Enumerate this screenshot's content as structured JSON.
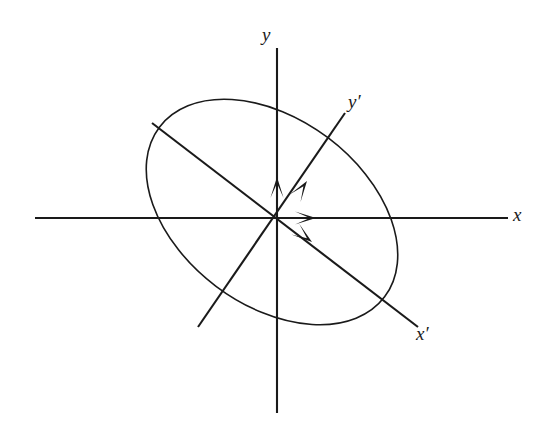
{
  "figure": {
    "kind": "diagram",
    "background_color": "#ffffff",
    "stroke_color": "#1a1a1a",
    "canvas": {
      "width": 540,
      "height": 442
    }
  },
  "labels": {
    "y_axis": "y",
    "x_axis": "x",
    "y_prime_axis": "y′",
    "x_prime_axis": "x′"
  },
  "geometry": {
    "origin": {
      "x": 277,
      "y": 218
    },
    "axes": [
      {
        "name": "y-axis",
        "label": "y",
        "from": {
          "x": 277,
          "y": 413
        },
        "to": {
          "x": 277,
          "y": 48
        },
        "arrow_tip": {
          "x": 277,
          "y": 177
        },
        "label_pos": {
          "x": 262,
          "y": 25
        },
        "stroke_width": 2.1
      },
      {
        "name": "x-axis",
        "label": "x",
        "from": {
          "x": 35,
          "y": 218
        },
        "to": {
          "x": 508,
          "y": 218
        },
        "arrow_tip": {
          "x": 316,
          "y": 218
        },
        "label_pos": {
          "x": 513,
          "y": 205
        },
        "stroke_width": 2.1
      },
      {
        "name": "y-prime-axis",
        "label": "y′",
        "from": {
          "x": 198,
          "y": 327
        },
        "to": {
          "x": 345,
          "y": 113
        },
        "arrow_tip": {
          "x": 307,
          "y": 181
        },
        "label_pos": {
          "x": 348,
          "y": 92
        },
        "stroke_width": 2.1
      },
      {
        "name": "x-prime-axis",
        "label": "x′",
        "from": {
          "x": 152,
          "y": 123
        },
        "to": {
          "x": 418,
          "y": 327
        },
        "arrow_tip": {
          "x": 312,
          "y": 242
        },
        "label_pos": {
          "x": 416,
          "y": 324
        },
        "stroke_width": 2.1
      }
    ],
    "ellipse": {
      "name": "tilted-ellipse",
      "center": {
        "x": 272,
        "y": 212
      },
      "radius_major": 141,
      "radius_minor": 93,
      "rotation_deg": 37,
      "stroke_width": 1.6,
      "fill": "none"
    }
  }
}
